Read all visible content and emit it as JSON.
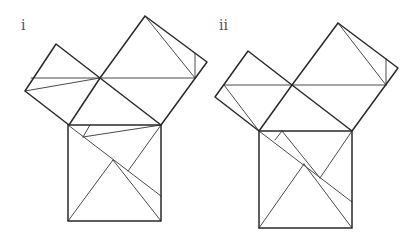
{
  "figures": [
    {
      "label": "i",
      "label_pos": [
        21,
        30
      ],
      "squares": [
        {
          "name": "small-square",
          "points": [
            [
              56,
              44
            ],
            [
              100,
              78
            ],
            [
              69,
              125
            ],
            [
              25,
              91
            ]
          ]
        },
        {
          "name": "large-square",
          "points": [
            [
              145,
              16
            ],
            [
              207,
              62
            ],
            [
              161,
              125
            ],
            [
              100,
              78
            ]
          ]
        },
        {
          "name": "hypotenuse-square",
          "points": [
            [
              68,
              125
            ],
            [
              161,
              125
            ],
            [
              161,
              221
            ],
            [
              68,
              221
            ]
          ]
        }
      ],
      "cuts": [
        [
          [
            31,
            78
          ],
          [
            195,
            78
          ]
        ],
        [
          [
            25,
            91
          ],
          [
            100,
            78
          ]
        ],
        [
          [
            145,
            16
          ],
          [
            195,
            78
          ]
        ],
        [
          [
            195,
            53
          ],
          [
            195,
            78
          ]
        ],
        [
          [
            68,
            125
          ],
          [
            161,
            196
          ]
        ],
        [
          [
            83,
            137
          ],
          [
            161,
            125
          ]
        ],
        [
          [
            83,
            137
          ],
          [
            90,
            125
          ]
        ],
        [
          [
            68,
            221
          ],
          [
            113,
            160
          ]
        ],
        [
          [
            113,
            160
          ],
          [
            161,
            221
          ]
        ],
        [
          [
            161,
            125
          ],
          [
            128,
            171
          ]
        ]
      ]
    },
    {
      "label": "ii",
      "label_pos": [
        219,
        30
      ],
      "squares": [
        {
          "name": "small-square",
          "points": [
            [
              248,
              51
            ],
            [
              292,
              85
            ],
            [
              259,
              131
            ],
            [
              215,
              97
            ]
          ]
        },
        {
          "name": "large-square",
          "points": [
            [
              338,
              23
            ],
            [
              398,
              68
            ],
            [
              352,
              131
            ],
            [
              292,
              85
            ]
          ]
        },
        {
          "name": "hypotenuse-square",
          "points": [
            [
              259,
              131
            ],
            [
              352,
              131
            ],
            [
              352,
              228
            ],
            [
              259,
              228
            ]
          ]
        }
      ],
      "cuts": [
        [
          [
            224,
            85
          ],
          [
            386,
            85
          ]
        ],
        [
          [
            224,
            85
          ],
          [
            259,
            131
          ]
        ],
        [
          [
            338,
            23
          ],
          [
            386,
            85
          ]
        ],
        [
          [
            386,
            59
          ],
          [
            386,
            85
          ]
        ],
        [
          [
            259,
            131
          ],
          [
            352,
            202
          ]
        ],
        [
          [
            282,
            131
          ],
          [
            320,
            178
          ]
        ],
        [
          [
            275,
            140
          ],
          [
            282,
            131
          ]
        ],
        [
          [
            259,
            228
          ],
          [
            304,
            164
          ]
        ],
        [
          [
            304,
            164
          ],
          [
            352,
            228
          ]
        ],
        [
          [
            352,
            131
          ],
          [
            320,
            178
          ]
        ]
      ]
    }
  ],
  "colors": {
    "background": "#ffffff",
    "edge": "#2a2a2a",
    "cut": "#4a4a4a",
    "label": "#555555"
  }
}
